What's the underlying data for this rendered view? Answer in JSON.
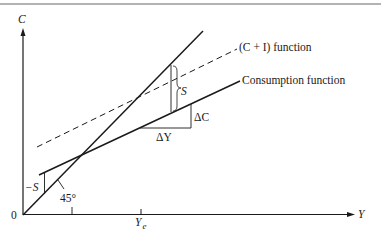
{
  "diagram": {
    "type": "keynesian-cross",
    "top_rule_color": "#9a9a9a",
    "line_color": "#1a1a1a",
    "axes": {
      "y_label": "C",
      "x_label": "Y",
      "origin_label": "0",
      "x_tick_label": "Y",
      "x_tick_subscript": "e"
    },
    "lines": {
      "forty_five": {
        "label": "45°"
      },
      "c_plus_i": {
        "label": "(C + I) function",
        "style": "dashed"
      },
      "consumption": {
        "label": "Consumption function",
        "style": "solid"
      }
    },
    "annotations": {
      "saving_positive": "S",
      "saving_negative": "−S",
      "delta_c": "ΔC",
      "delta_y": "ΔY"
    }
  }
}
